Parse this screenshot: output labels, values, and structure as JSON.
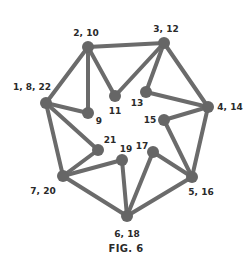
{
  "figure": {
    "caption": "FIG. 6",
    "colors": {
      "edge": "#6b6b6b",
      "node": "#666666",
      "label": "#2a2a2a",
      "background": "#ffffff"
    }
  },
  "nodes": [
    {
      "id": "n2_10",
      "label": "2, 10",
      "x": 88,
      "y": 47,
      "lx": 86,
      "ly": 36,
      "anchor": "middle"
    },
    {
      "id": "n3_12",
      "label": "3, 12",
      "x": 164,
      "y": 43,
      "lx": 166,
      "ly": 32,
      "anchor": "middle"
    },
    {
      "id": "n1_8_22",
      "label": "1, 8, 22",
      "x": 46,
      "y": 103,
      "lx": 32,
      "ly": 90,
      "anchor": "middle"
    },
    {
      "id": "n9",
      "label": "9",
      "x": 88,
      "y": 113,
      "lx": 99,
      "ly": 124,
      "anchor": "middle"
    },
    {
      "id": "n11",
      "label": "11",
      "x": 115,
      "y": 96,
      "lx": 115,
      "ly": 114,
      "anchor": "middle"
    },
    {
      "id": "n13",
      "label": "13",
      "x": 146,
      "y": 92,
      "lx": 137,
      "ly": 106,
      "anchor": "middle"
    },
    {
      "id": "n4_14",
      "label": "4, 14",
      "x": 208,
      "y": 107,
      "lx": 230,
      "ly": 110,
      "anchor": "middle"
    },
    {
      "id": "n15",
      "label": "15",
      "x": 164,
      "y": 120,
      "lx": 150,
      "ly": 123,
      "anchor": "middle"
    },
    {
      "id": "n21",
      "label": "21",
      "x": 98,
      "y": 150,
      "lx": 110,
      "ly": 143,
      "anchor": "middle"
    },
    {
      "id": "n19",
      "label": "19",
      "x": 122,
      "y": 160,
      "lx": 126,
      "ly": 152,
      "anchor": "middle"
    },
    {
      "id": "n17",
      "label": "17",
      "x": 153,
      "y": 152,
      "lx": 142,
      "ly": 149,
      "anchor": "middle"
    },
    {
      "id": "n7_20",
      "label": "7, 20",
      "x": 63,
      "y": 176,
      "lx": 43,
      "ly": 194,
      "anchor": "middle"
    },
    {
      "id": "n5_16",
      "label": "5, 16",
      "x": 192,
      "y": 177,
      "lx": 201,
      "ly": 195,
      "anchor": "middle"
    },
    {
      "id": "n6_18",
      "label": "6, 18",
      "x": 127,
      "y": 216,
      "lx": 127,
      "ly": 237,
      "anchor": "middle"
    }
  ],
  "edges": [
    [
      "n2_10",
      "n3_12"
    ],
    [
      "n2_10",
      "n1_8_22"
    ],
    [
      "n2_10",
      "n9"
    ],
    [
      "n2_10",
      "n11"
    ],
    [
      "n11",
      "n3_12"
    ],
    [
      "n3_12",
      "n13"
    ],
    [
      "n3_12",
      "n4_14"
    ],
    [
      "n13",
      "n4_14"
    ],
    [
      "n4_14",
      "n15"
    ],
    [
      "n4_14",
      "n5_16"
    ],
    [
      "n15",
      "n5_16"
    ],
    [
      "n1_8_22",
      "n9"
    ],
    [
      "n1_8_22",
      "n21"
    ],
    [
      "n1_8_22",
      "n7_20"
    ],
    [
      "n21",
      "n7_20"
    ],
    [
      "n7_20",
      "n19"
    ],
    [
      "n7_20",
      "n6_18"
    ],
    [
      "n19",
      "n6_18"
    ],
    [
      "n6_18",
      "n17"
    ],
    [
      "n17",
      "n5_16"
    ],
    [
      "n6_18",
      "n5_16"
    ]
  ]
}
